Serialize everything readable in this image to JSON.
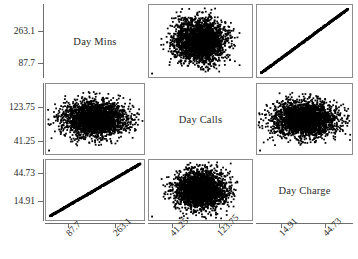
{
  "figure": {
    "type": "scatter-plot-matrix",
    "variables": [
      "Day Mins",
      "Day Calls",
      "Day Charge"
    ],
    "width": 358,
    "height": 259,
    "point_color": "#000000",
    "frame_color": "#8c8c8c",
    "axis_color": "#6e6e6e",
    "background": "#ffffff"
  },
  "diagonal": {
    "cell_0": "Day Mins",
    "cell_1": "Day Calls",
    "cell_2": "Day Charge"
  },
  "axes": {
    "rows": [
      {
        "variable": "Day Mins",
        "ticks": [
          "263.1",
          "87.7"
        ]
      },
      {
        "variable": "Day Calls",
        "ticks": [
          "123.75",
          "41.25"
        ]
      },
      {
        "variable": "Day Charge",
        "ticks": [
          "44.73",
          "14.91"
        ]
      }
    ],
    "columns": [
      {
        "variable": "Day Mins",
        "ticks": [
          "87.7",
          "263.1"
        ]
      },
      {
        "variable": "Day Calls",
        "ticks": [
          "41.25",
          "123.75"
        ]
      },
      {
        "variable": "Day Charge",
        "ticks": [
          "14.91",
          "44.73"
        ]
      }
    ]
  },
  "chart_data": {
    "type": "scatter",
    "title": "",
    "xlabel": "",
    "ylabel": "",
    "grid": false,
    "legend": "none",
    "variables": [
      {
        "name": "Day Mins",
        "ticks": [
          87.7,
          263.1
        ],
        "range": [
          0,
          350
        ]
      },
      {
        "name": "Day Calls",
        "ticks": [
          41.25,
          123.75
        ],
        "range": [
          0,
          165
        ]
      },
      {
        "name": "Day Charge",
        "ticks": [
          14.91,
          44.73
        ],
        "range": [
          0,
          59.5
        ]
      }
    ],
    "panels": [
      {
        "row": 0,
        "col": 0,
        "kind": "diagonal",
        "label": "Day Mins"
      },
      {
        "row": 0,
        "col": 1,
        "kind": "scatter",
        "x": "Day Calls",
        "y": "Day Mins",
        "relationship": "uncorrelated",
        "correlation": 0.0,
        "shape": "round-cloud",
        "n": 3333
      },
      {
        "row": 0,
        "col": 2,
        "kind": "scatter",
        "x": "Day Charge",
        "y": "Day Mins",
        "relationship": "perfect-linear",
        "correlation": 1.0,
        "shape": "straight-line",
        "n": 3333
      },
      {
        "row": 1,
        "col": 0,
        "kind": "scatter",
        "x": "Day Mins",
        "y": "Day Calls",
        "relationship": "uncorrelated",
        "correlation": 0.0,
        "shape": "wide-ellipse-cloud",
        "n": 3333
      },
      {
        "row": 1,
        "col": 1,
        "kind": "diagonal",
        "label": "Day Calls"
      },
      {
        "row": 1,
        "col": 2,
        "kind": "scatter",
        "x": "Day Charge",
        "y": "Day Calls",
        "relationship": "uncorrelated",
        "correlation": 0.0,
        "shape": "wide-ellipse-cloud",
        "n": 3333
      },
      {
        "row": 2,
        "col": 0,
        "kind": "scatter",
        "x": "Day Mins",
        "y": "Day Charge",
        "relationship": "perfect-linear",
        "correlation": 1.0,
        "shape": "straight-line",
        "n": 3333
      },
      {
        "row": 2,
        "col": 1,
        "kind": "scatter",
        "x": "Day Calls",
        "y": "Day Charge",
        "relationship": "uncorrelated",
        "correlation": 0.0,
        "shape": "round-cloud",
        "n": 3333
      },
      {
        "row": 2,
        "col": 2,
        "kind": "diagonal",
        "label": "Day Charge"
      }
    ]
  }
}
